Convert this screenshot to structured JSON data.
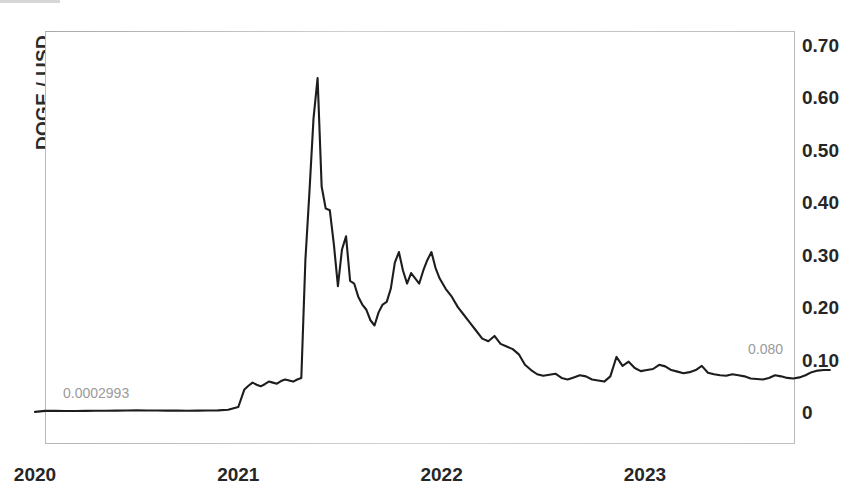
{
  "chart_data": {
    "type": "line",
    "title": "",
    "subtitle": "",
    "xlabel": "",
    "ylabel": "DOGE / USD",
    "grid": false,
    "legend": null,
    "legend_position": "none",
    "xlim": [
      "2020-01-01",
      "2023-12-01"
    ],
    "ylim": [
      0,
      0.7
    ],
    "y_ticks": [
      "0",
      "0.10",
      "0.20",
      "0.30",
      "0.40",
      "0.50",
      "0.60",
      "0.70"
    ],
    "y_tick_values": [
      0,
      0.1,
      0.2,
      0.3,
      0.4,
      0.5,
      0.6,
      0.7
    ],
    "x_ticks": [
      "2020",
      "2021",
      "2022",
      "2023"
    ],
    "x_tick_values": [
      2020,
      2021,
      2022,
      2023
    ],
    "annotations": [
      {
        "name": "start-value",
        "text": "0.0002993",
        "x": 2020.05,
        "y": 0.05
      },
      {
        "name": "end-value",
        "text": "0.080",
        "x": 2023.72,
        "y": 0.135
      }
    ],
    "series": [
      {
        "name": "DOGE / USD",
        "color": "#1d1d1d",
        "x": [
          2020.0,
          2020.05,
          2020.1,
          2020.15,
          2020.2,
          2020.25,
          2020.3,
          2020.35,
          2020.4,
          2020.45,
          2020.5,
          2020.55,
          2020.6,
          2020.65,
          2020.7,
          2020.75,
          2020.8,
          2020.85,
          2020.9,
          2020.95,
          2021.0,
          2021.03,
          2021.05,
          2021.07,
          2021.09,
          2021.11,
          2021.13,
          2021.15,
          2021.17,
          2021.19,
          2021.21,
          2021.23,
          2021.25,
          2021.27,
          2021.29,
          2021.31,
          2021.33,
          2021.35,
          2021.37,
          2021.39,
          2021.41,
          2021.43,
          2021.45,
          2021.47,
          2021.49,
          2021.51,
          2021.53,
          2021.55,
          2021.57,
          2021.59,
          2021.61,
          2021.63,
          2021.65,
          2021.67,
          2021.69,
          2021.71,
          2021.73,
          2021.75,
          2021.77,
          2021.79,
          2021.81,
          2021.83,
          2021.85,
          2021.87,
          2021.89,
          2021.91,
          2021.93,
          2021.95,
          2021.97,
          2021.99,
          2022.02,
          2022.05,
          2022.08,
          2022.11,
          2022.14,
          2022.17,
          2022.2,
          2022.23,
          2022.26,
          2022.29,
          2022.32,
          2022.35,
          2022.38,
          2022.41,
          2022.44,
          2022.47,
          2022.5,
          2022.53,
          2022.56,
          2022.59,
          2022.62,
          2022.65,
          2022.68,
          2022.71,
          2022.74,
          2022.77,
          2022.8,
          2022.83,
          2022.86,
          2022.89,
          2022.92,
          2022.95,
          2022.98,
          2023.01,
          2023.04,
          2023.07,
          2023.1,
          2023.13,
          2023.16,
          2023.19,
          2023.22,
          2023.25,
          2023.28,
          2023.31,
          2023.34,
          2023.37,
          2023.4,
          2023.43,
          2023.46,
          2023.49,
          2023.52,
          2023.55,
          2023.58,
          2023.61,
          2023.64,
          2023.67,
          2023.7,
          2023.73,
          2023.76,
          2023.79,
          2023.82,
          2023.85,
          2023.88,
          2023.91
        ],
        "y": [
          0.0003,
          0.0022,
          0.0021,
          0.002,
          0.0019,
          0.0022,
          0.0024,
          0.0023,
          0.0026,
          0.003,
          0.0034,
          0.003,
          0.0028,
          0.0027,
          0.0026,
          0.0025,
          0.0027,
          0.0029,
          0.0031,
          0.0042,
          0.0095,
          0.043,
          0.05,
          0.056,
          0.052,
          0.049,
          0.053,
          0.058,
          0.056,
          0.054,
          0.059,
          0.062,
          0.06,
          0.058,
          0.062,
          0.065,
          0.29,
          0.42,
          0.56,
          0.637,
          0.43,
          0.388,
          0.385,
          0.32,
          0.24,
          0.31,
          0.335,
          0.25,
          0.245,
          0.22,
          0.205,
          0.195,
          0.175,
          0.165,
          0.19,
          0.205,
          0.21,
          0.235,
          0.285,
          0.305,
          0.27,
          0.245,
          0.265,
          0.255,
          0.245,
          0.27,
          0.29,
          0.305,
          0.275,
          0.255,
          0.235,
          0.22,
          0.2,
          0.185,
          0.17,
          0.155,
          0.14,
          0.135,
          0.145,
          0.13,
          0.125,
          0.12,
          0.11,
          0.09,
          0.08,
          0.072,
          0.069,
          0.071,
          0.073,
          0.065,
          0.062,
          0.066,
          0.07,
          0.068,
          0.062,
          0.06,
          0.058,
          0.068,
          0.105,
          0.088,
          0.096,
          0.084,
          0.078,
          0.08,
          0.082,
          0.09,
          0.087,
          0.08,
          0.077,
          0.074,
          0.076,
          0.08,
          0.088,
          0.075,
          0.072,
          0.07,
          0.069,
          0.072,
          0.07,
          0.068,
          0.064,
          0.063,
          0.062,
          0.065,
          0.07,
          0.068,
          0.065,
          0.064,
          0.066,
          0.07,
          0.076,
          0.079,
          0.08,
          0.08
        ]
      }
    ]
  }
}
